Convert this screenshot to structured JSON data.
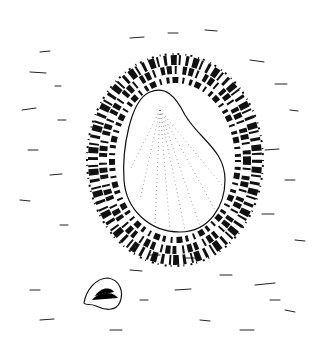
{
  "image": {
    "description": "Pen-and-ink illustration of a large limpet shell surrounded by a dark speckled halo on a sandy surface, with a small shell at lower left",
    "width": 334,
    "height": 354,
    "colors": {
      "background": "#ffffff",
      "ink": "#111111"
    },
    "subjects": [
      {
        "name": "large-shell",
        "center": [
          165,
          160
        ]
      },
      {
        "name": "speckled-halo",
        "center": [
          175,
          160
        ]
      },
      {
        "name": "small-shell",
        "center": [
          100,
          293
        ]
      }
    ]
  }
}
